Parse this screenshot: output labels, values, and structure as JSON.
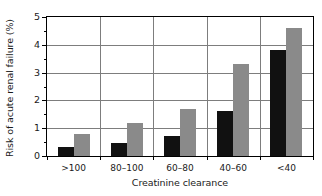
{
  "chart_data": {
    "type": "bar",
    "title": "",
    "xlabel": "Creatinine clearance",
    "ylabel": "Risk of acute renal failure (%)",
    "categories": [
      ">100",
      "80–100",
      "60–80",
      "40–60",
      "<40"
    ],
    "series": [
      {
        "name": "black",
        "color": "#111111",
        "values": [
          0.33,
          0.48,
          0.73,
          1.61,
          3.8
        ]
      },
      {
        "name": "grey",
        "color": "#8a8a8a",
        "values": [
          0.78,
          1.18,
          1.68,
          3.3,
          4.6
        ]
      }
    ],
    "ylim": [
      0,
      5
    ],
    "ytick_labels": [
      "0",
      "1",
      "2",
      "3",
      "4",
      "5"
    ],
    "ytick_values": [
      0,
      1,
      2,
      3,
      4,
      5
    ],
    "yminor_values": [
      0.5,
      1.5,
      2.5,
      3.5,
      4.5
    ],
    "grid": "horizontal-and-vertical",
    "legend": "none",
    "axis_color": "#000000",
    "grid_color": "#7d7d7d",
    "background": "#ffffff"
  }
}
